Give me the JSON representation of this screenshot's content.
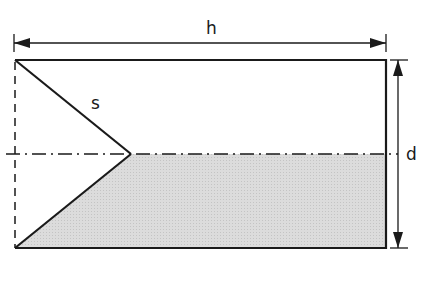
{
  "diagram": {
    "labels": {
      "width": "h",
      "height": "d",
      "slant": "s"
    },
    "colors": {
      "stroke": "#1a1a1a",
      "fill_shaded": "#d6d6d6",
      "background": "#ffffff"
    },
    "geometry": {
      "rect": {
        "x1": 15,
        "y1": 60,
        "x2": 386,
        "y2": 248
      },
      "apex": {
        "x": 131,
        "y": 154
      },
      "centerline_y": 154,
      "h_dimension_y": 43,
      "d_dimension_x": 398
    }
  }
}
